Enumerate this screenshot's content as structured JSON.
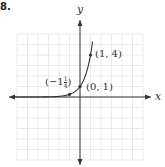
{
  "problem_number": "8.",
  "chart_data": {
    "type": "line",
    "function": "y = 4^x",
    "series": [
      {
        "name": "y = 4^x",
        "x": [
          -6,
          -3,
          -2,
          -1,
          0,
          0.5,
          1,
          1.2
        ],
        "y": [
          0.0002,
          0.0156,
          0.0625,
          0.25,
          1,
          2,
          4,
          5.28
        ]
      }
    ],
    "points": [
      {
        "x": 0,
        "y": 1,
        "label": "(0, 1)"
      },
      {
        "x": 1,
        "y": 4,
        "label": "(1, 4)"
      },
      {
        "x": -1,
        "y": 0.25,
        "label": "(−1¼)"
      }
    ],
    "title": "",
    "xlabel": "x",
    "ylabel": "y",
    "xlim": [
      -6,
      6
    ],
    "ylim": [
      -6,
      6
    ],
    "grid": true,
    "legend": "none"
  },
  "labels": {
    "x_axis": "x",
    "y_axis": "y",
    "p1": "(1, 4)",
    "p0": "(0, 1)",
    "pm1_prefix": "(−1",
    "pm1_num": "1",
    "pm1_den": "4",
    "pm1_suffix": ")"
  }
}
